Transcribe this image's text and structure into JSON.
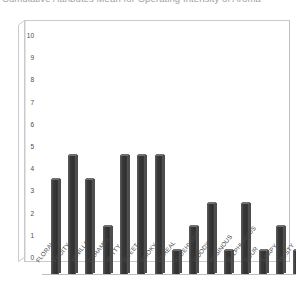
{
  "title": {
    "text": "Cumulative Attributes Mean for Operating Intensity of Aroma",
    "visible_fragment": "cropped at top edge of image"
  },
  "axes": {
    "y_ticks": [
      0,
      1,
      2,
      3,
      4,
      5,
      6,
      7,
      8,
      9,
      10
    ],
    "y_min": 0,
    "y_max": 10,
    "x_labels": [
      "FLORAL",
      "FRUITY",
      "VANILLA",
      "CARAMEL",
      "NUTTY",
      "SWEET",
      "SMOKY",
      "CEREAL",
      "ALDEHYDIC",
      "WOODY",
      "RESINOUS",
      "SULPHUROUS",
      "SOUR",
      "SOAPY",
      "MUSTY"
    ]
  },
  "style": {
    "bar_color": "#3a3a3a",
    "bar_highlight": "#6f6f6f",
    "frame_color": "#c9c9cf",
    "text_color": "#4a4a4a",
    "background": "#ffffff"
  },
  "chart_data": {
    "type": "bar",
    "title": "Cumulative Attributes Mean for Operating Intensity of Aroma",
    "xlabel": "",
    "ylabel": "",
    "ylim": [
      0,
      10
    ],
    "grid": false,
    "legend": null,
    "categories": [
      "FLORAL",
      "FRUITY",
      "VANILLA",
      "CARAMEL",
      "NUTTY",
      "SWEET",
      "SMOKY",
      "CEREAL",
      "ALDEHYDIC",
      "WOODY",
      "RESINOUS",
      "SULPHUROUS",
      "SOUR",
      "SOAPY",
      "MUSTY"
    ],
    "values": [
      4,
      5,
      4,
      2,
      5,
      5,
      5,
      1,
      2,
      3,
      1,
      3,
      1,
      2,
      1
    ]
  }
}
